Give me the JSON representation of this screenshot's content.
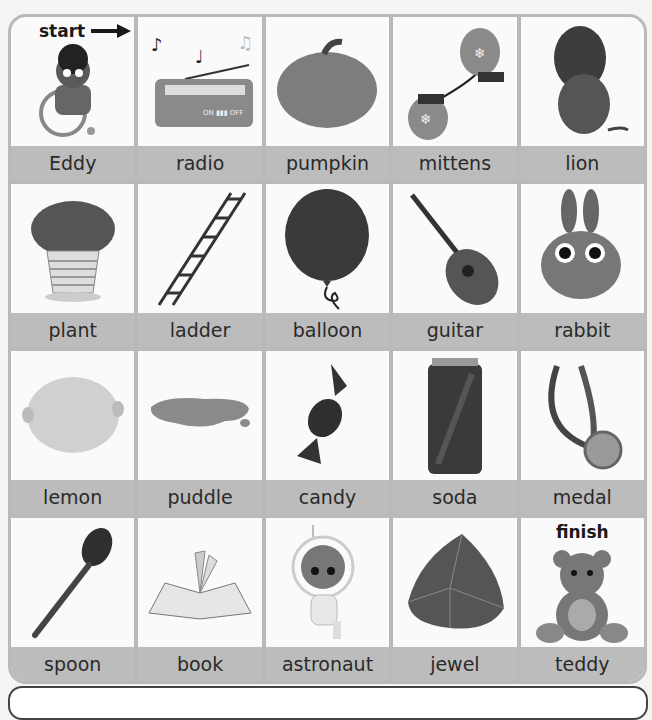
{
  "board": {
    "start_label": "start",
    "finish_label": "finish",
    "cells": [
      {
        "label": "Eddy",
        "icon": "boy-wheelchair-icon"
      },
      {
        "label": "radio",
        "icon": "radio-icon"
      },
      {
        "label": "pumpkin",
        "icon": "pumpkin-icon"
      },
      {
        "label": "mittens",
        "icon": "mittens-icon"
      },
      {
        "label": "lion",
        "icon": "lion-icon"
      },
      {
        "label": "plant",
        "icon": "plant-icon"
      },
      {
        "label": "ladder",
        "icon": "ladder-icon"
      },
      {
        "label": "balloon",
        "icon": "balloon-icon"
      },
      {
        "label": "guitar",
        "icon": "guitar-icon"
      },
      {
        "label": "rabbit",
        "icon": "rabbit-icon"
      },
      {
        "label": "lemon",
        "icon": "lemon-icon"
      },
      {
        "label": "puddle",
        "icon": "puddle-icon"
      },
      {
        "label": "candy",
        "icon": "candy-icon"
      },
      {
        "label": "soda",
        "icon": "soda-can-icon"
      },
      {
        "label": "medal",
        "icon": "medal-icon"
      },
      {
        "label": "spoon",
        "icon": "spoon-icon"
      },
      {
        "label": "book",
        "icon": "book-icon"
      },
      {
        "label": "astronaut",
        "icon": "astronaut-icon"
      },
      {
        "label": "jewel",
        "icon": "jewel-icon"
      },
      {
        "label": "teddy",
        "icon": "teddy-bear-icon"
      }
    ]
  }
}
